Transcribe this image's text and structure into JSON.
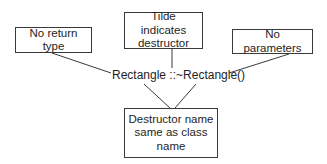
{
  "diagram": {
    "type": "annotated-code-callout",
    "center_label": "Rectangle ::~Rectangle()",
    "callouts": [
      {
        "id": "return",
        "lines": [
          "No return type"
        ]
      },
      {
        "id": "tilde",
        "lines": [
          "Tilde indicates",
          "destructor"
        ]
      },
      {
        "id": "params",
        "lines": [
          "No parameters"
        ]
      },
      {
        "id": "name",
        "lines": [
          "Destructor name",
          "same as class",
          "name"
        ]
      }
    ],
    "colors": {
      "stroke": "#3a3a3a",
      "text": "#1e1e1e",
      "background": "#ffffff"
    }
  }
}
